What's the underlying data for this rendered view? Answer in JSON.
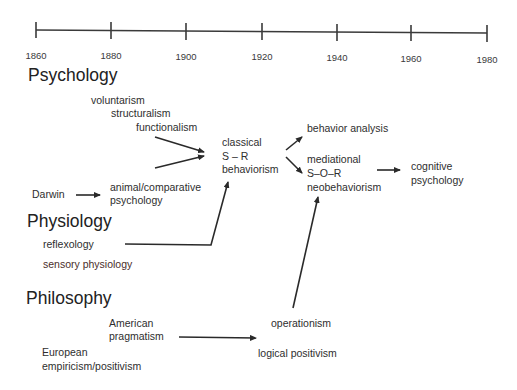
{
  "timeline": {
    "ticks": [
      {
        "label": "1860",
        "x": 36
      },
      {
        "label": "1880",
        "x": 111
      },
      {
        "label": "1900",
        "x": 186
      },
      {
        "label": "1920",
        "x": 262
      },
      {
        "label": "1940",
        "x": 337
      },
      {
        "label": "1960",
        "x": 411
      },
      {
        "label": "1980",
        "x": 487
      }
    ]
  },
  "sections": {
    "psychology": "Psychology",
    "physiology": "Physiology",
    "philosophy": "Philosophy"
  },
  "nodes": {
    "voluntarism": "voluntarism",
    "structuralism": "structuralism",
    "functionalism": "functionalism",
    "darwin": "Darwin",
    "animal_line1": "animal/comparative",
    "animal_line2": "psychology",
    "classical_line1": "classical",
    "classical_line2": "S – R",
    "classical_line3": "behaviorism",
    "behavior_analysis": "behavior analysis",
    "mediational_line1": "mediational",
    "mediational_line2": "S–O–R",
    "mediational_line3": "neobehaviorism",
    "cognitive_line1": "cognitive",
    "cognitive_line2": "psychology",
    "reflexology": "reflexology",
    "sensory_physiology": "sensory physiology",
    "american_line1": "American",
    "american_line2": "pragmatism",
    "european_line1": "European",
    "european_line2": "empiricism/positivism",
    "operationism": "operationism",
    "logical_positivism": "logical positivism"
  },
  "colors": {
    "ink": "#2e2e2e",
    "sensory": "#4a2e2a",
    "background": "#ffffff"
  }
}
